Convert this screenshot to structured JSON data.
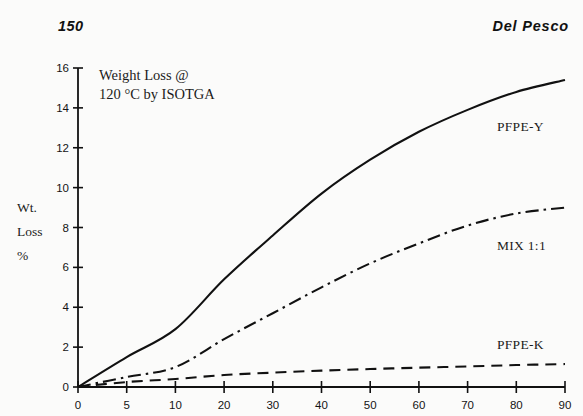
{
  "page": {
    "running_head_left": "150",
    "running_head_right": "Del Pesco"
  },
  "chart_data": {
    "type": "line",
    "title": "",
    "annotation_line1": "Weight Loss @",
    "annotation_line2": "120 °C by ISOTGA",
    "xlabel": "",
    "ylabel_line1": "Wt.",
    "ylabel_line2": "Loss",
    "ylabel_line3": "%",
    "xlim": [
      0,
      90
    ],
    "ylim": [
      0,
      16
    ],
    "grid": false,
    "legend_position": "inline-right",
    "xticks": [
      0,
      5,
      10,
      20,
      30,
      40,
      50,
      60,
      70,
      80,
      90
    ],
    "xtick_labels": [
      "0",
      "5",
      "10",
      "20",
      "30",
      "40",
      "50",
      "60",
      "70",
      "80",
      "90"
    ],
    "yticks": [
      0,
      2,
      4,
      6,
      8,
      10,
      12,
      14,
      16
    ],
    "ytick_labels": [
      "0",
      "2",
      "4",
      "6",
      "8",
      "10",
      "12",
      "14",
      "16"
    ],
    "axis_note": "x-axis uses a split scale: 0-5 and 5-10 each occupy the same width as one 10-unit decade",
    "series": [
      {
        "name": "PFPE-Y",
        "style": "solid",
        "label": "PFPE-Y",
        "x": [
          0,
          5,
          10,
          20,
          30,
          40,
          50,
          60,
          70,
          80,
          90
        ],
        "values": [
          0,
          1.5,
          2.9,
          5.4,
          7.6,
          9.7,
          11.4,
          12.8,
          13.9,
          14.8,
          15.4
        ]
      },
      {
        "name": "MIX 1:1",
        "style": "dash-dot",
        "label": "MIX 1:1",
        "x": [
          0,
          5,
          10,
          20,
          30,
          40,
          50,
          60,
          70,
          80,
          90
        ],
        "values": [
          0,
          0.5,
          1.0,
          2.4,
          3.7,
          5.0,
          6.2,
          7.2,
          8.1,
          8.7,
          9.0
        ]
      },
      {
        "name": "PFPE-K",
        "style": "dashed",
        "label": "PFPE-K",
        "x": [
          0,
          5,
          10,
          20,
          30,
          40,
          50,
          60,
          70,
          80,
          90
        ],
        "values": [
          0,
          0.25,
          0.4,
          0.6,
          0.72,
          0.82,
          0.9,
          0.97,
          1.03,
          1.1,
          1.15
        ]
      }
    ],
    "colors": {
      "line": "#111111",
      "axis": "#111111",
      "background": "#fbfbfa"
    }
  }
}
